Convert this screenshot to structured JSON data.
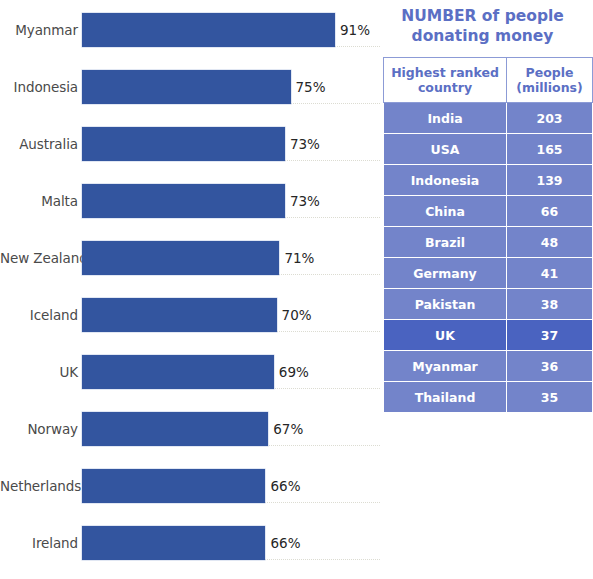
{
  "chart_data": {
    "type": "bar",
    "orientation": "horizontal",
    "title": "",
    "xlabel": "",
    "ylabel": "",
    "xlim": [
      0,
      100
    ],
    "grid": true,
    "unit": "%",
    "categories": [
      "Myanmar",
      "Indonesia",
      "Australia",
      "Malta",
      "New Zealand",
      "Iceland",
      "UK",
      "Norway",
      "Netherlands",
      "Ireland"
    ],
    "values": [
      91,
      75,
      73,
      73,
      71,
      70,
      69,
      67,
      66,
      66
    ],
    "value_labels": [
      "91%",
      "75%",
      "73%",
      "73%",
      "71%",
      "70%",
      "69%",
      "67%",
      "66%",
      "66%"
    ],
    "bar_color": "#33559f"
  },
  "bar_chart": {
    "rows": [
      {
        "label": "Myanmar",
        "value": 91,
        "value_label": "91%"
      },
      {
        "label": "Indonesia",
        "value": 75,
        "value_label": "75%"
      },
      {
        "label": "Australia",
        "value": 73,
        "value_label": "73%"
      },
      {
        "label": "Malta",
        "value": 73,
        "value_label": "73%"
      },
      {
        "label": "New Zealand",
        "value": 71,
        "value_label": "71%"
      },
      {
        "label": "Iceland",
        "value": 70,
        "value_label": "70%"
      },
      {
        "label": "UK",
        "value": 69,
        "value_label": "69%"
      },
      {
        "label": "Norway",
        "value": 67,
        "value_label": "67%"
      },
      {
        "label": "Netherlands",
        "value": 66,
        "value_label": "66%"
      },
      {
        "label": "Ireland",
        "value": 66,
        "value_label": "66%"
      }
    ]
  },
  "table_panel": {
    "title": "NUMBER of people donating money",
    "title_line1": "NUMBER of people",
    "title_line2": "donating money",
    "headers": {
      "country": "Highest ranked country",
      "country_line1": "Highest ranked",
      "country_line2": "country",
      "people": "People (millions)",
      "people_line1": "People",
      "people_line2": "(millions)"
    },
    "rows": [
      {
        "country": "India",
        "people": "203",
        "highlighted": false
      },
      {
        "country": "USA",
        "people": "165",
        "highlighted": false
      },
      {
        "country": "Indonesia",
        "people": "139",
        "highlighted": false
      },
      {
        "country": "China",
        "people": "66",
        "highlighted": false
      },
      {
        "country": "Brazil",
        "people": "48",
        "highlighted": false
      },
      {
        "country": "Germany",
        "people": "41",
        "highlighted": false
      },
      {
        "country": "Pakistan",
        "people": "38",
        "highlighted": false
      },
      {
        "country": "UK",
        "people": "37",
        "highlighted": true
      },
      {
        "country": "Myanmar",
        "people": "36",
        "highlighted": false
      },
      {
        "country": "Thailand",
        "people": "35",
        "highlighted": false
      }
    ]
  },
  "colors": {
    "bar": "#33559f",
    "table_row": "#7384ca",
    "table_row_highlight": "#4a63c0",
    "title_blue": "#5b6fc4",
    "gridline": "#dcdcd2",
    "label_text": "#4a4a4a"
  }
}
